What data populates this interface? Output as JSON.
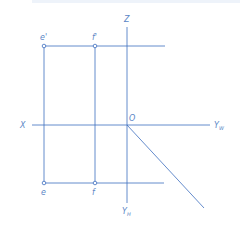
{
  "diagram": {
    "type": "orthographic-projection",
    "line_color": "#3d6fbf",
    "label_color": "#5b86c6",
    "axes": {
      "x": "X",
      "z": "Z",
      "origin": "O",
      "yw": "Y",
      "yw_sub": "W",
      "yh": "Y",
      "yh_sub": "H"
    },
    "points": {
      "e_prime": "e'",
      "f_prime": "f'",
      "e": "e",
      "f": "f"
    }
  }
}
